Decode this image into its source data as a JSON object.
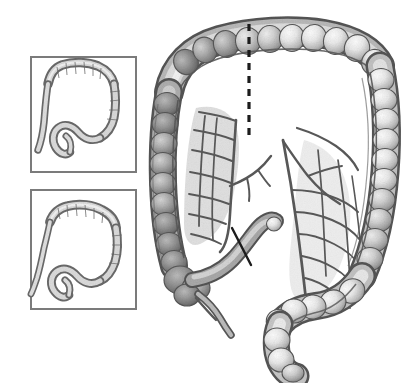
{
  "figure": {
    "title": "Large intestine (colon) anatomical illustration with resection margins",
    "style": "grayscale pen-and-ink medical illustration",
    "background_color": "#ffffff",
    "canvas": {
      "width": 401,
      "height": 383
    }
  },
  "palette": {
    "background": "#ffffff",
    "outline_dark": "#4a4a4a",
    "outline_mid": "#6e6e6e",
    "bowel_light": "#f2f2f2",
    "bowel_mid": "#c9c9c9",
    "bowel_shadow": "#8d8d8d",
    "bowel_deep_shadow": "#5f5f5f",
    "mesentery_fill": "#d2d2d2",
    "vessel_line": "#585858",
    "marker_line": "#1c1c1c",
    "inset_border": "#7b7b7b"
  },
  "insets": [
    {
      "id": "inset-top",
      "name": "inset-panel-top",
      "label": "",
      "variant": "colon-outline-variant-a",
      "frame": {
        "x": 30,
        "y": 56,
        "width": 107,
        "height": 117
      },
      "border_color": "#7b7b7b",
      "border_width": 2
    },
    {
      "id": "inset-bottom",
      "name": "inset-panel-bottom",
      "label": "",
      "variant": "colon-outline-variant-b",
      "frame": {
        "x": 30,
        "y": 189,
        "width": 107,
        "height": 121
      },
      "border_color": "#7b7b7b",
      "border_width": 2
    }
  ],
  "main_illustration": {
    "name": "large-intestine-main-view",
    "bounds": {
      "x": 152,
      "y": 18,
      "width": 240,
      "height": 358
    },
    "segments": [
      {
        "id": "transverse-colon",
        "label": "Transverse colon",
        "haustra_count": 14
      },
      {
        "id": "hepatic-flexure",
        "label": "Hepatic flexure",
        "haustra_count": 3
      },
      {
        "id": "splenic-flexure",
        "label": "Splenic flexure",
        "haustra_count": 3
      },
      {
        "id": "ascending-colon",
        "label": "Ascending colon",
        "haustra_count": 11
      },
      {
        "id": "descending-colon",
        "label": "Descending colon",
        "haustra_count": 13
      },
      {
        "id": "cecum",
        "label": "Cecum",
        "haustra_count": 3
      },
      {
        "id": "appendix",
        "label": "Vermiform appendix",
        "haustra_count": 0
      },
      {
        "id": "ileum",
        "label": "Terminal ileum",
        "haustra_count": 0
      },
      {
        "id": "sigmoid-colon",
        "label": "Sigmoid colon",
        "haustra_count": 7
      },
      {
        "id": "rectum",
        "label": "Rectum",
        "haustra_count": 2
      }
    ],
    "mesentery": {
      "id": "mesenteric-vessels",
      "label": "Mesenteric vascular arcades",
      "arcade_regions": [
        "right-mesocolon",
        "transverse-mesocolon",
        "left-mesocolon",
        "sigmoid-mesocolon"
      ]
    }
  },
  "markers": [
    {
      "id": "resection-line-transverse",
      "name": "dashed-resection-line",
      "label": "Proximal resection margin",
      "style": "dashed",
      "orientation": "vertical",
      "color": "#1c1c1c",
      "stroke_width": 3.2,
      "dash_pattern": "7 6",
      "x1": 249,
      "y1": 24,
      "x2": 249,
      "y2": 138
    },
    {
      "id": "resection-line-ileum",
      "name": "solid-resection-line",
      "label": "Distal ileal resection margin",
      "style": "solid",
      "orientation": "diagonal",
      "color": "#1c1c1c",
      "stroke_width": 2.4,
      "x1": 232,
      "y1": 228,
      "x2": 251,
      "y2": 265
    }
  ]
}
